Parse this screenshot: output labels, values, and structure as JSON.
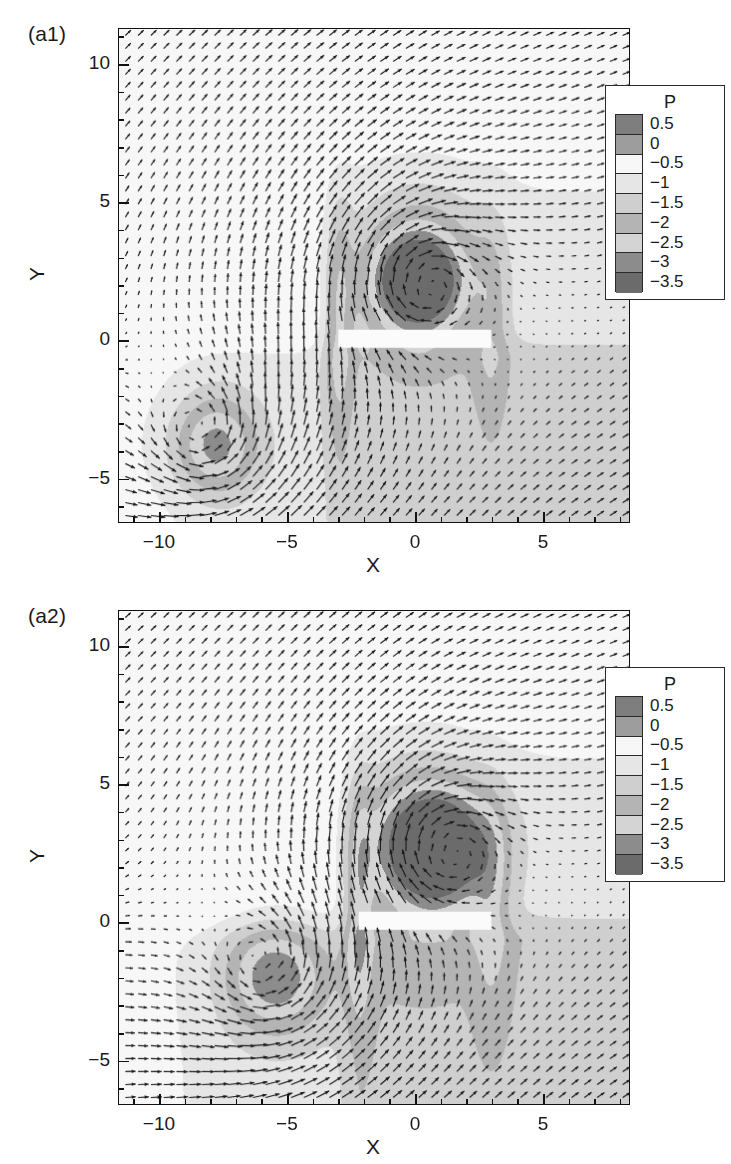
{
  "figure": {
    "width": 731,
    "height": 1164,
    "background": "#ffffff"
  },
  "chart_data": [
    {
      "type": "heatmap",
      "title": "(a1)",
      "subtitle": "Instantaneous velocity vectors overlaid on pressure contours",
      "xlabel": "X",
      "ylabel": "Y",
      "xlim": [
        -11.6,
        8.4
      ],
      "ylim": [
        -6.6,
        11.3
      ],
      "xticks": [
        -10,
        -5,
        0,
        5
      ],
      "xtick_labels": [
        "−10",
        "−5",
        "0",
        "5"
      ],
      "yticks": [
        10,
        5,
        0,
        -5
      ],
      "ytick_labels": [
        "10",
        "5",
        "0",
        "−5"
      ],
      "minor_tick_step": 1,
      "grid": false,
      "legend_position": "upper-right-inside",
      "colorbar": {
        "variable": "P",
        "levels": [
          0.5,
          0,
          -0.5,
          -1,
          -1.5,
          -2,
          -2.5,
          -3,
          -3.5
        ],
        "level_labels": [
          "0.5",
          "0",
          "−0.5",
          "−1",
          "−1.5",
          "−2",
          "−2.5",
          "−3",
          "−3.5"
        ],
        "band_colors": [
          "#7e7e7e",
          "#9d9d9d",
          "#f7f7f7",
          "#e6e6e6",
          "#cfcfcf",
          "#b4b4b4",
          "#d4d4d4",
          "#8c8c8c",
          "#6b6b6b"
        ]
      },
      "features": {
        "plate": {
          "x_start": -3.0,
          "x_end": 3.0,
          "y": 0.0,
          "thickness": 0.55,
          "color": "#fbfbfb"
        },
        "vortices": [
          {
            "name": "upper-vortex",
            "x": 0.1,
            "y": 2.1,
            "core_radius": 0.85,
            "core_pressure": -3.0,
            "rotation": "clockwise"
          },
          {
            "name": "lower-left-vortex",
            "x": -8.1,
            "y": -3.8,
            "core_radius": 0.9,
            "core_pressure": -2.6,
            "rotation": "counter-clockwise"
          }
        ],
        "low_pressure_lobe": {
          "x": 0.2,
          "y": 3.0,
          "rx": 2.6,
          "ry": 4.2
        },
        "wake_region_pressure": -1.2,
        "freestream_pressure": 0.0
      },
      "vector_field": {
        "nx": 40,
        "ny": 38,
        "arrow_color": "#1b1b1b",
        "description": "Upper-half flow directed up-and-right; strong shear columns near X=-3 and X=3; recirculating vectors around both vortex cores."
      }
    },
    {
      "type": "heatmap",
      "title": "(a2)",
      "subtitle": "Instantaneous velocity vectors overlaid on pressure contours",
      "xlabel": "X",
      "ylabel": "Y",
      "xlim": [
        -11.6,
        8.4
      ],
      "ylim": [
        -6.6,
        11.3
      ],
      "xticks": [
        -10,
        -5,
        0,
        5
      ],
      "xtick_labels": [
        "−10",
        "−5",
        "0",
        "5"
      ],
      "yticks": [
        10,
        5,
        0,
        -5
      ],
      "ytick_labels": [
        "10",
        "5",
        "0",
        "−5"
      ],
      "minor_tick_step": 1,
      "grid": false,
      "legend_position": "upper-right-inside",
      "colorbar": {
        "variable": "P",
        "levels": [
          0.5,
          0,
          -0.5,
          -1,
          -1.5,
          -2,
          -2.5,
          -3,
          -3.5
        ],
        "level_labels": [
          "0.5",
          "0",
          "−0.5",
          "−1",
          "−1.5",
          "−2",
          "−2.5",
          "−3",
          "−3.5"
        ],
        "band_colors": [
          "#7e7e7e",
          "#9d9d9d",
          "#f7f7f7",
          "#e6e6e6",
          "#cfcfcf",
          "#b4b4b4",
          "#d4d4d4",
          "#8c8c8c",
          "#6b6b6b"
        ]
      },
      "features": {
        "plate": {
          "x_start": -2.2,
          "x_end": 3.0,
          "y": 0.0,
          "thickness": 0.55,
          "color": "#fbfbfb"
        },
        "vortices": [
          {
            "name": "upper-vortex",
            "x": 0.8,
            "y": 2.7,
            "core_radius": 1.0,
            "core_pressure": -3.2,
            "rotation": "clockwise"
          },
          {
            "name": "lower-left-vortex",
            "x": -5.5,
            "y": -2.0,
            "core_radius": 1.0,
            "core_pressure": -2.2,
            "rotation": "counter-clockwise"
          }
        ],
        "low_pressure_lobe": {
          "x": 0.4,
          "y": 3.6,
          "rx": 2.8,
          "ry": 4.6
        },
        "wake_region_pressure": -1.4,
        "freestream_pressure": 0.0
      },
      "vector_field": {
        "nx": 40,
        "ny": 38,
        "arrow_color": "#1b1b1b",
        "description": "Upper-half flow directed up-and-right; strong shear columns near X=-2 and X=3; recirculating vectors around both vortex cores."
      }
    }
  ]
}
